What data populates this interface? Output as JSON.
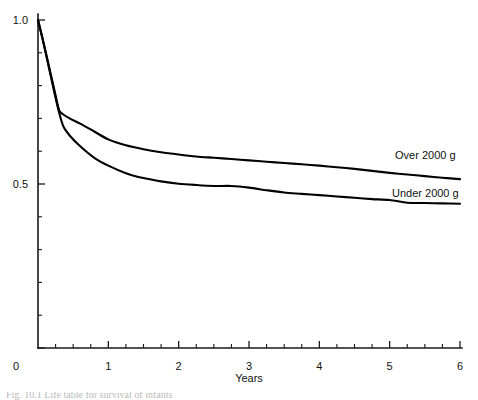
{
  "chart_data": {
    "type": "line",
    "title": "",
    "xlabel": "Years",
    "ylabel": "",
    "xlim": [
      0,
      6
    ],
    "ylim": [
      0,
      1.0
    ],
    "grid": false,
    "legend_position": "inline-right",
    "x_ticks": [
      0,
      1,
      2,
      3,
      4,
      5,
      6
    ],
    "x_tick_labels": [
      "0",
      "1",
      "2",
      "3",
      "4",
      "5",
      "6"
    ],
    "x_minor_step": 0.25,
    "y_ticks": [
      0,
      0.5,
      1.0
    ],
    "y_tick_labels": [
      "0",
      "0.5",
      "1.0"
    ],
    "y_minor_step": 0.1,
    "series": [
      {
        "name": "Over 2000 g",
        "label": "Over 2000 g",
        "color": "#000000",
        "x": [
          0.0,
          0.08,
          0.16,
          0.24,
          0.3,
          0.36,
          0.45,
          0.6,
          0.8,
          1.0,
          1.25,
          1.5,
          1.75,
          2.0,
          2.25,
          2.5,
          2.75,
          3.0,
          3.25,
          3.5,
          3.75,
          4.0,
          4.25,
          4.5,
          4.75,
          5.0,
          5.25,
          5.5,
          5.75,
          6.0
        ],
        "y": [
          1.0,
          0.93,
          0.855,
          0.78,
          0.725,
          0.712,
          0.7,
          0.684,
          0.66,
          0.636,
          0.618,
          0.606,
          0.597,
          0.59,
          0.584,
          0.58,
          0.576,
          0.572,
          0.568,
          0.564,
          0.56,
          0.556,
          0.551,
          0.546,
          0.54,
          0.534,
          0.529,
          0.524,
          0.519,
          0.515
        ]
      },
      {
        "name": "Under 2000 g",
        "label": "Under 2000 g",
        "color": "#000000",
        "x": [
          0.0,
          0.08,
          0.16,
          0.24,
          0.3,
          0.36,
          0.45,
          0.6,
          0.8,
          1.0,
          1.25,
          1.5,
          1.75,
          2.0,
          2.25,
          2.5,
          2.75,
          3.0,
          3.25,
          3.5,
          3.75,
          4.0,
          4.25,
          4.5,
          4.75,
          5.0,
          5.25,
          5.5,
          5.75,
          6.0
        ],
        "y": [
          1.0,
          0.928,
          0.85,
          0.772,
          0.718,
          0.676,
          0.648,
          0.615,
          0.58,
          0.556,
          0.533,
          0.518,
          0.508,
          0.501,
          0.497,
          0.494,
          0.494,
          0.489,
          0.481,
          0.474,
          0.47,
          0.466,
          0.462,
          0.458,
          0.454,
          0.451,
          0.443,
          0.442,
          0.441,
          0.44
        ]
      }
    ]
  },
  "labels": {
    "x_axis_title": "Years",
    "series_over_label": "Over 2000 g",
    "series_under_label": "Under 2000 g"
  },
  "caption": {
    "text": "Fig. 10.1  Life table for survival of infants"
  },
  "colors": {
    "background": "#ffffff",
    "axis": "#1a1a1a",
    "curve": "#000000",
    "text": "#111111"
  }
}
